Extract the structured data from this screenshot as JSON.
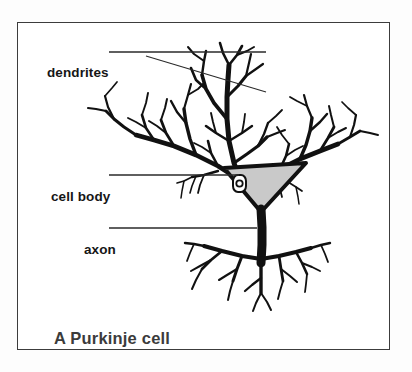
{
  "figure": {
    "caption": "A Purkinje cell",
    "background_color": "#ffffff",
    "frame_color": "#3c3c3c",
    "ink_color": "#111111",
    "soma_fill_color": "#c9c9c9"
  },
  "labels": {
    "dendrites": "dendrites",
    "cell_body": "cell body",
    "axon": "axon"
  },
  "annotations": {
    "dendrites_leader": "leader-line-horizontal-plus-diagonal",
    "cell_body_leader": "leader-line-horizontal",
    "axon_leader": "leader-line-horizontal"
  },
  "structures": {
    "dendritic_arbor": "branching dendritic tree",
    "soma": "triangular cell body with nucleus",
    "nucleus": "nucleus",
    "axon_shaft": "axon",
    "axon_terminals": "axon terminal branches"
  }
}
